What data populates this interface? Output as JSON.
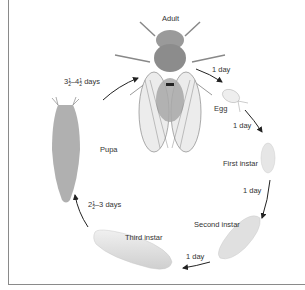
{
  "diagram": {
    "title_fragment": "",
    "stages": [
      {
        "id": "adult",
        "label": "Adult"
      },
      {
        "id": "egg",
        "label": "Egg"
      },
      {
        "id": "first_instar",
        "label": "First instar"
      },
      {
        "id": "second_instar",
        "label": "Second instar"
      },
      {
        "id": "third_instar",
        "label": "Third instar"
      },
      {
        "id": "pupa",
        "label": "Pupa"
      }
    ],
    "transitions": [
      {
        "from": "adult",
        "to": "egg",
        "label": "1 day"
      },
      {
        "from": "egg",
        "to": "first_instar",
        "label": "1 day"
      },
      {
        "from": "first_instar",
        "to": "second_instar",
        "label": "1 day"
      },
      {
        "from": "second_instar",
        "to": "third_instar",
        "label": "1 day"
      },
      {
        "from": "third_instar",
        "to": "pupa",
        "label_whole": "2",
        "label_num": "1",
        "label_den": "2",
        "label_rest": "–3 days"
      },
      {
        "from": "pupa",
        "to": "adult",
        "label_whole1": "3",
        "label_num1": "1",
        "label_den1": "2",
        "label_mid": "–4",
        "label_num2": "1",
        "label_den2": "2",
        "label_rest": " days"
      }
    ],
    "colors": {
      "arrow": "#222222",
      "frame": "#8a8a8a",
      "body_gray": "#b8b8b8",
      "larva": "#e2e2e2"
    }
  }
}
